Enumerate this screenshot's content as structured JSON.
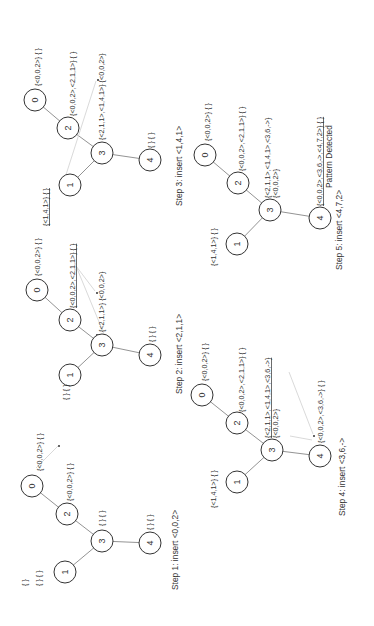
{
  "figure": {
    "orientation": "rotated -90 degrees",
    "steps": [
      {
        "caption": "Step 1: insert <0,0,2>",
        "nodes": {
          "n0": {
            "id": "0",
            "label": "{<0,0,2>} { }"
          },
          "n2": {
            "id": "2",
            "label": "{<0,0,2>} { }"
          },
          "n3": {
            "id": "3",
            "label": "{ } { }"
          },
          "n4": {
            "id": "4",
            "label": "{ } { }"
          },
          "n1": {
            "id": "1",
            "label": "{ } { }"
          }
        },
        "extra_label": "{ }"
      },
      {
        "caption": "Step 2: insert <2,1,1>",
        "nodes": {
          "n0": {
            "id": "0",
            "label": "{<0,0,2>} { }"
          },
          "n2": {
            "id": "2",
            "label": "{<0,0,2>,<2,1,1>} { }"
          },
          "n3": {
            "id": "3",
            "label": "{<2,1,1>} {<0,0,2>}"
          },
          "n4": {
            "id": "4",
            "label": "{ } { }"
          },
          "n1": {
            "id": "1",
            "label": "{ } { }"
          }
        }
      },
      {
        "caption": "Step 3: insert <1,4,1>",
        "nodes": {
          "n0": {
            "id": "0",
            "label": "{<0,0,2>} { }"
          },
          "n2": {
            "id": "2",
            "label": "{<0,0,2>,<2,1,1>} { }"
          },
          "n3": {
            "id": "3",
            "label": "{<2,1,1>,<1,4,1>} {<0,0,2>}"
          },
          "n4": {
            "id": "4",
            "label": "{ } { }"
          },
          "n1": {
            "id": "1",
            "label": "{<1,4,1>} { }"
          }
        }
      },
      {
        "caption": "Step 4: insert <3,6,->",
        "nodes": {
          "n0": {
            "id": "0",
            "label": "{<0,0,2>} { }"
          },
          "n2": {
            "id": "2",
            "label": "{<0,0,2>,<2,1,1>} { }"
          },
          "n3": {
            "id": "3",
            "label": "{<2,1,1>,<1,4,1>,<3,6,->}",
            "label2": "{<0,0,2>}"
          },
          "n4": {
            "id": "4",
            "label": "{<0,0,2>,<3,6,->} { }"
          },
          "n1": {
            "id": "1",
            "label": "{<1,4,1>} { }"
          }
        }
      },
      {
        "caption": "Step 5: insert <4,7,2>",
        "nodes": {
          "n0": {
            "id": "0",
            "label": "{<0,0,2>} { }"
          },
          "n2": {
            "id": "2",
            "label": "{<0,0,2>,<2,1,1>} { }"
          },
          "n3": {
            "id": "3",
            "label": "{<2,1,1>,<1,4,1>,<3,6,->}",
            "label2": "{<0,0,2>}"
          },
          "n4": {
            "id": "4",
            "label": "{<0,0,2>,<3,6,->,<4,7,2>} { }"
          },
          "n1": {
            "id": "1",
            "label": "{<1,4,1>} { }"
          }
        },
        "status": "Pattern Detected"
      }
    ]
  }
}
